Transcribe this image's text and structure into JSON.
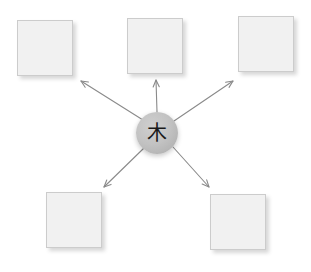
{
  "diagram": {
    "type": "radial-hub-and-spoke",
    "background_color": "#ffffff",
    "hub": {
      "glyph": "木",
      "glyph_name": "cjk-character-tree",
      "shape": "circle",
      "center_x": 157,
      "center_y": 133,
      "radius": 21,
      "fill_color": "#c2c2c2",
      "glyph_color": "#1a1a1a"
    },
    "node_style": {
      "fill_color": "#f1f1f1",
      "border_color": "#cccccc",
      "shadow_color": "rgba(0,0,0,0.16)",
      "width": 56,
      "height": 56
    },
    "arrow_style": {
      "color": "#8a8a8a",
      "stroke_width": 1.1,
      "head_style": "open-v"
    },
    "nodes": [
      {
        "id": "node-top-left",
        "label": "",
        "x": 17,
        "y": 20
      },
      {
        "id": "node-top-center",
        "label": "",
        "x": 127,
        "y": 18
      },
      {
        "id": "node-top-right",
        "label": "",
        "x": 238,
        "y": 16
      },
      {
        "id": "node-bottom-left",
        "label": "",
        "x": 46,
        "y": 192
      },
      {
        "id": "node-bottom-right",
        "label": "",
        "x": 210,
        "y": 194
      }
    ],
    "arrows": [
      {
        "id": "arrow-to-top-left",
        "from_x": 143,
        "from_y": 120,
        "to_x": 81,
        "to_y": 81,
        "direction": "up-left"
      },
      {
        "id": "arrow-to-top-center",
        "from_x": 157,
        "from_y": 112,
        "to_x": 156,
        "to_y": 80,
        "direction": "up"
      },
      {
        "id": "arrow-to-top-right",
        "from_x": 174,
        "from_y": 121,
        "to_x": 233,
        "to_y": 81,
        "direction": "up-right"
      },
      {
        "id": "arrow-to-bottom-left",
        "from_x": 144,
        "from_y": 148,
        "to_x": 104,
        "to_y": 187,
        "direction": "down-left"
      },
      {
        "id": "arrow-to-bottom-right",
        "from_x": 173,
        "from_y": 147,
        "to_x": 209,
        "to_y": 187,
        "direction": "down-right"
      }
    ]
  }
}
